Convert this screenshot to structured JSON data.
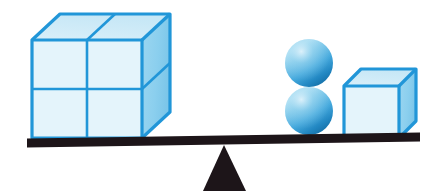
{
  "figure": {
    "name": "balance-scale-diagram",
    "background_color": "#ffffff",
    "width": 440,
    "height": 196
  },
  "palette": {
    "outline_blue": "#2196d8",
    "outline_blue_dark": "#1b82bf",
    "face_front": "#e4f4fb",
    "face_top": "#d3ecf8",
    "face_right": "#8fd0ee",
    "sphere_light": "#a9ddf2",
    "sphere_mid": "#49aade",
    "sphere_dark": "#1b7cb5",
    "beam_dark": "#1d1519",
    "fulcrum_dark": "#1d1519"
  },
  "beam": {
    "label": "balance-beam",
    "x1": 27,
    "y1": 143,
    "x2": 420,
    "y2": 137,
    "thickness": 9,
    "color": "#1d1519"
  },
  "fulcrum": {
    "label": "fulcrum-triangle",
    "apex_x": 224,
    "apex_y": 145,
    "base_left_x": 203,
    "base_right_x": 246,
    "base_y": 191,
    "color": "#1d1519"
  },
  "left_pan": {
    "label": "left-side-load",
    "object": "large-cube-block",
    "description": "Large cube composed of 2 by 2 by 2 unit cubes",
    "unit_cube_count": 8,
    "front_rows": 2,
    "front_cols": 2,
    "front": {
      "x": 32,
      "y": 40,
      "width": 110,
      "height": 98
    },
    "depth_dx": 28,
    "depth_dy": -26
  },
  "right_pan": {
    "label": "right-side-load",
    "objects": [
      {
        "name": "sphere-top",
        "shape": "sphere",
        "cx": 309,
        "cy": 63,
        "r": 24
      },
      {
        "name": "sphere-bottom",
        "shape": "sphere",
        "cx": 309,
        "cy": 111,
        "r": 24
      },
      {
        "name": "small-cube",
        "shape": "cube",
        "front": {
          "x": 344,
          "y": 86,
          "width": 55,
          "height": 52
        },
        "depth_dx": 17,
        "depth_dy": -17
      }
    ]
  },
  "chart_data": {
    "type": "diagram",
    "categories": [
      "left pan",
      "right pan"
    ],
    "items": [
      {
        "side": "left",
        "shape": "cube",
        "count": 1,
        "composed_of_unit_cubes": 8
      },
      {
        "side": "right",
        "shape": "sphere",
        "count": 2
      },
      {
        "side": "right",
        "shape": "cube",
        "count": 1
      }
    ],
    "state": "balanced",
    "xlabel": "",
    "ylabel": ""
  }
}
